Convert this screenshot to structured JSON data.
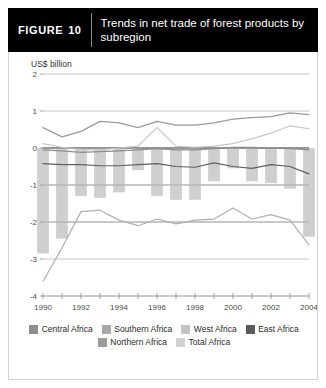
{
  "header": {
    "figure_word": "FIGURE",
    "figure_number": "10",
    "title": "Trends in net trade of forest products by subregion"
  },
  "colors": {
    "header_bg": "#000000",
    "header_text": "#ffffff",
    "card_border": "#d2d2d2",
    "central_africa": "#b3b3b3",
    "southern_africa": "#9e9e9e",
    "west_africa": "#c9c9c9",
    "east_africa": "#5a5a5a",
    "northern_africa": "#8a8a8a",
    "total_africa": "#cfcfcf",
    "gridline": "#c4c4c4",
    "zero_line": "#6f6f6f",
    "axis": "#8a8a8a"
  },
  "legend": {
    "rows": [
      [
        {
          "label": "Central Africa",
          "color": "#8f8f8f"
        },
        {
          "label": "Southern Africa",
          "color": "#a8a8a8"
        },
        {
          "label": "West Africa",
          "color": "#c2c2c2"
        },
        {
          "label": "East Africa",
          "color": "#5a5a5a"
        }
      ],
      [
        {
          "label": "Northern Africa",
          "color": "#9c9c9c"
        },
        {
          "label": "Total Africa",
          "color": "#d2d2d2"
        }
      ]
    ]
  },
  "chart_data": {
    "type": "line",
    "title": "Trends in net trade of forest products by subregion",
    "xlabel": "",
    "ylabel": "US$ billion",
    "ylim": [
      -4,
      2
    ],
    "yticks": [
      2,
      1,
      0,
      -1,
      -2,
      -3,
      -4
    ],
    "ytick_labels": [
      "2",
      "1",
      "0",
      "-1",
      "-2",
      "-3",
      "-4"
    ],
    "grid": true,
    "gridlines_at": [
      2,
      1,
      0,
      -1,
      -2,
      -3
    ],
    "legend_position": "bottom",
    "x": [
      1990,
      1991,
      1992,
      1993,
      1994,
      1995,
      1996,
      1997,
      1998,
      1999,
      2000,
      2001,
      2002,
      2003,
      2004
    ],
    "xticks": [
      1990,
      1991,
      1992,
      1993,
      1994,
      1995,
      1996,
      1997,
      1998,
      1999,
      2000,
      2001,
      2002,
      2003,
      2004
    ],
    "xtick_labels_shown": [
      "1990",
      "1992",
      "1994",
      "1996",
      "1998",
      "2000",
      "2002",
      "2004"
    ],
    "bar_series": {
      "name": "Total Africa",
      "color": "#cfcfcf",
      "values": [
        -2.85,
        -2.45,
        -1.3,
        -1.35,
        -1.2,
        -0.6,
        -1.3,
        -1.4,
        -1.4,
        -0.9,
        -0.55,
        -0.9,
        -0.95,
        -1.1,
        -2.4
      ]
    },
    "series": [
      {
        "name": "Central Africa",
        "color": "#b0b0b0",
        "values": [
          -3.6,
          -2.7,
          -1.72,
          -1.68,
          -1.95,
          -2.1,
          -1.92,
          -2.05,
          -1.95,
          -1.92,
          -1.62,
          -1.92,
          -1.8,
          -1.95,
          -2.62
        ]
      },
      {
        "name": "Southern Africa",
        "color": "#9a9a9a",
        "values": [
          0.55,
          0.3,
          0.45,
          0.72,
          0.68,
          0.55,
          0.72,
          0.62,
          0.62,
          0.68,
          0.78,
          0.82,
          0.85,
          0.95,
          0.9
        ]
      },
      {
        "name": "West Africa",
        "color": "#c6c6c6",
        "values": [
          0.12,
          0.02,
          -0.05,
          -0.05,
          0.0,
          0.05,
          0.55,
          0.05,
          0.02,
          0.05,
          0.12,
          0.25,
          0.4,
          0.6,
          0.52
        ]
      },
      {
        "name": "East Africa",
        "color": "#5f5f5f",
        "values": [
          -0.42,
          -0.45,
          -0.45,
          -0.48,
          -0.48,
          -0.45,
          -0.42,
          -0.5,
          -0.52,
          -0.4,
          -0.5,
          -0.55,
          -0.45,
          -0.5,
          -0.7
        ]
      },
      {
        "name": "Northern Africa",
        "color": "#8d8d8d",
        "values": [
          -0.05,
          -0.08,
          -0.12,
          -0.1,
          -0.08,
          -0.05,
          -0.02,
          -0.05,
          -0.05,
          -0.02,
          0.02,
          0.02,
          0.0,
          -0.02,
          -0.05
        ]
      }
    ]
  }
}
